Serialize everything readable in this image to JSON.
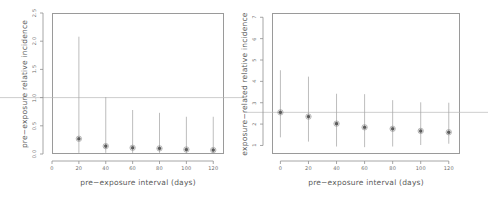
{
  "figure": {
    "background": "#ffffff",
    "point_color": "#5d5d5d",
    "errorbar_color": "#a7a7a7",
    "reference_line_color": "#b9b9b9",
    "axis_color": "#8f8f8f",
    "text_color": "#6e6e6e"
  },
  "chart_data": [
    {
      "id": "left",
      "type": "scatter",
      "title": "",
      "xlabel": "pre−exposure interval (days)",
      "ylabel": "pre−exposure relative incidence",
      "x": [
        20,
        40,
        60,
        80,
        100,
        120
      ],
      "values": [
        0.27,
        0.14,
        0.11,
        0.1,
        0.08,
        0.07
      ],
      "ci_low": [
        0.02,
        0.02,
        0.02,
        0.02,
        0.02,
        0.02
      ],
      "ci_high": [
        2.08,
        1.01,
        0.78,
        0.73,
        0.66,
        0.66
      ],
      "xlim": [
        0,
        128
      ],
      "ylim": [
        0.0,
        2.5
      ],
      "xticks": [
        0,
        20,
        40,
        60,
        80,
        100,
        120
      ],
      "xticklabels": [
        "0",
        "20",
        "40",
        "60",
        "80",
        "100",
        "120"
      ],
      "yticks": [
        0.0,
        0.5,
        1.0,
        1.5,
        2.0,
        2.5
      ],
      "yticklabels": [
        "0.0",
        "0.5",
        "1.0",
        "1.5",
        "2.0",
        "2.5"
      ],
      "reference_line_y": 1.0,
      "grid": false,
      "legend": "none"
    },
    {
      "id": "right",
      "type": "scatter",
      "title": "",
      "xlabel": "pre−exposure interval (days)",
      "ylabel": "exposure−related relative incidence",
      "x": [
        0,
        20,
        40,
        60,
        80,
        100,
        120
      ],
      "values": [
        2.55,
        2.35,
        2.02,
        1.85,
        1.78,
        1.68,
        1.62
      ],
      "ci_low": [
        1.38,
        1.18,
        0.95,
        0.92,
        0.95,
        1.02,
        1.08
      ],
      "ci_high": [
        4.52,
        4.22,
        3.42,
        3.4,
        3.12,
        3.02,
        3.0
      ],
      "xlim": [
        -6,
        128
      ],
      "ylim": [
        0.6,
        7.2
      ],
      "xticks": [
        0,
        20,
        40,
        60,
        80,
        100,
        120
      ],
      "xticklabels": [
        "0",
        "20",
        "40",
        "60",
        "80",
        "100",
        "120"
      ],
      "yticks": [
        1,
        2,
        3,
        4,
        5,
        6,
        7
      ],
      "yticklabels": [
        "1",
        "2",
        "3",
        "4",
        "5",
        "6",
        "7"
      ],
      "reference_line_y": 2.55,
      "grid": false,
      "legend": "none"
    }
  ]
}
